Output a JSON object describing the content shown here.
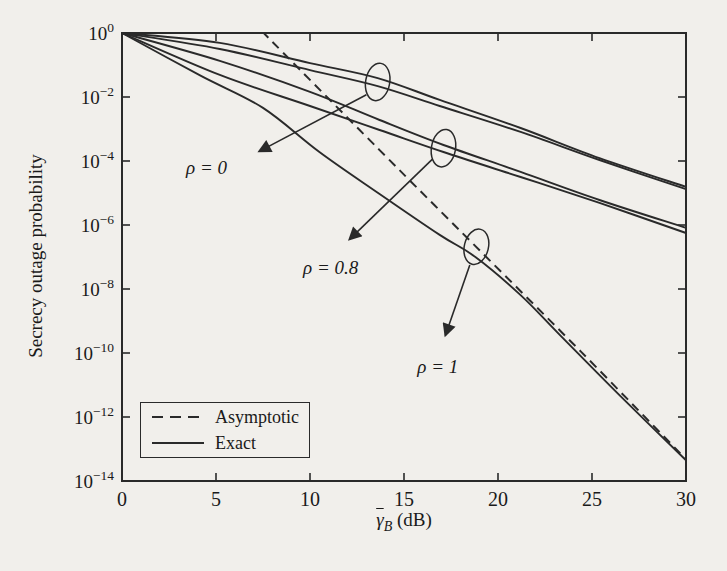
{
  "figure": {
    "ink_color": "#2a2a2a",
    "text_color": "#1a1a1a",
    "background_color": "#f1efeb"
  },
  "chart_data": {
    "type": "line",
    "title": "",
    "xlabel": {
      "symbol": "γ",
      "subscript": "B",
      "suffix": " (dB)",
      "overline": true
    },
    "ylabel": "Secrecy outage probability",
    "xlim": [
      0,
      30
    ],
    "x_ticks": [
      0,
      5,
      10,
      15,
      20,
      25,
      30
    ],
    "y_scale": "log",
    "ylim_exponents": [
      0,
      -14
    ],
    "y_tick_exponents": [
      0,
      -2,
      -4,
      -6,
      -8,
      -10,
      -12,
      -14
    ],
    "grid": false,
    "legend_position": "lower-left",
    "legend": [
      {
        "label": "Asymptotic",
        "style": "dashed"
      },
      {
        "label": "Exact",
        "style": "solid"
      }
    ],
    "series": [
      {
        "name": "rho0-curve-1",
        "style": "solid",
        "x": [
          0,
          5.2,
          10.0,
          13.6,
          16.9,
          21.2,
          25.4,
          30
        ],
        "log10p": [
          0,
          -0.31,
          -0.94,
          -1.41,
          -2.09,
          -2.97,
          -3.91,
          -4.81
        ]
      },
      {
        "name": "rho0-curve-2",
        "style": "solid",
        "x": [
          0,
          5.2,
          10.0,
          13.6,
          16.9,
          21.2,
          25.4,
          30
        ],
        "log10p": [
          0,
          -0.5,
          -1.16,
          -1.66,
          -2.28,
          -3.09,
          -3.97,
          -4.88
        ]
      },
      {
        "name": "rho08-curve-1",
        "style": "solid",
        "x": [
          0,
          5.2,
          10.0,
          13.7,
          17.1,
          21.2,
          25.4,
          30
        ],
        "log10p": [
          0,
          -0.87,
          -1.84,
          -2.72,
          -3.5,
          -4.34,
          -5.22,
          -6.09
        ]
      },
      {
        "name": "rho08-curve-2",
        "style": "solid",
        "x": [
          0,
          5.2,
          10.0,
          13.7,
          17.1,
          21.2,
          25.4,
          30
        ],
        "log10p": [
          0,
          -1.31,
          -2.28,
          -3.03,
          -3.72,
          -4.5,
          -5.31,
          -6.25
        ]
      },
      {
        "name": "rho1-exact",
        "style": "solid",
        "x": [
          0,
          4.2,
          7.5,
          10.5,
          13.7,
          16.9,
          18.8,
          21.2,
          23.3,
          26.5,
          30
        ],
        "log10p": [
          0,
          -1.34,
          -2.34,
          -3.72,
          -5.03,
          -6.31,
          -7.0,
          -8.19,
          -9.44,
          -11.34,
          -13.35
        ]
      },
      {
        "name": "rho1-asymptotic",
        "style": "dashed",
        "x": [
          7.45,
          13.7,
          18.8,
          24.4,
          30
        ],
        "log10p": [
          0.05,
          -3.66,
          -6.66,
          -9.95,
          -13.32
        ]
      }
    ],
    "annotations": [
      {
        "label": "ρ = 0",
        "label_pos": {
          "x": 4.5,
          "log10p": -4.22
        },
        "ellipse": {
          "x": 13.6,
          "log10p": -1.53,
          "rx_db": 0.64,
          "ry_dec": 0.59,
          "tilt_deg": 10
        },
        "arrow": {
          "from": {
            "x": 13.0,
            "log10p": -1.93
          },
          "to": {
            "x": 7.3,
            "log10p": -3.7
          }
        }
      },
      {
        "label": "ρ = 0.8",
        "label_pos": {
          "x": 11.1,
          "log10p": -7.35
        },
        "ellipse": {
          "x": 17.1,
          "log10p": -3.6,
          "rx_db": 0.64,
          "ry_dec": 0.59,
          "tilt_deg": 10
        },
        "arrow": {
          "from": {
            "x": 16.5,
            "log10p": -3.95
          },
          "to": {
            "x": 12.1,
            "log10p": -6.45
          }
        }
      },
      {
        "label": "ρ = 1",
        "label_pos": {
          "x": 16.8,
          "log10p": -10.45
        },
        "ellipse": {
          "x": 18.85,
          "log10p": -6.68,
          "rx_db": 0.64,
          "ry_dec": 0.56,
          "tilt_deg": 14
        },
        "arrow": {
          "from": {
            "x": 18.5,
            "log10p": -7.25
          },
          "to": {
            "x": 17.2,
            "log10p": -9.45
          }
        }
      }
    ]
  }
}
